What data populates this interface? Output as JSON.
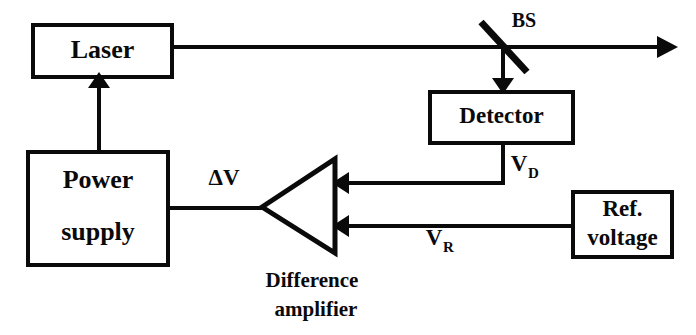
{
  "diagram": {
    "background_color": "#ffffff",
    "line_color": "#0a0a0a",
    "blocks": {
      "laser": {
        "label": "Laser"
      },
      "power_supply": {
        "label_line1": "Power",
        "label_line2": "supply"
      },
      "detector": {
        "label": "Detector"
      },
      "ref_voltage": {
        "label_line1": "Ref.",
        "label_line2": "voltage"
      },
      "amplifier": {
        "caption_line1": "Difference",
        "caption_line2": "amplifier"
      }
    },
    "components": {
      "beam_splitter": {
        "label": "BS"
      }
    },
    "signals": {
      "delta_v": {
        "symbol": "ΔV"
      },
      "v_detector": {
        "symbol": "V",
        "subscript": "D"
      },
      "v_reference": {
        "symbol": "V",
        "subscript": "R"
      }
    }
  }
}
